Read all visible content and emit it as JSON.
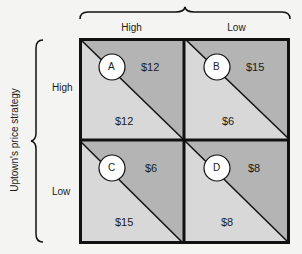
{
  "columns": {
    "labels": [
      "High",
      "Low"
    ]
  },
  "rows": {
    "axis_label": "Uptown's price strategy",
    "labels": [
      "High",
      "Low"
    ]
  },
  "colors": {
    "upper_triangle": "#b4b4b4",
    "lower_triangle": "#d8d8d8",
    "border": "#111111",
    "circle_fill": "#ffffff",
    "background": "#f4f4f2"
  },
  "cells": [
    {
      "id": "A",
      "upper_price": "$12",
      "lower_price": "$12"
    },
    {
      "id": "B",
      "upper_price": "$15",
      "lower_price": "$6"
    },
    {
      "id": "C",
      "upper_price": "$6",
      "lower_price": "$15"
    },
    {
      "id": "D",
      "upper_price": "$8",
      "lower_price": "$8"
    }
  ]
}
